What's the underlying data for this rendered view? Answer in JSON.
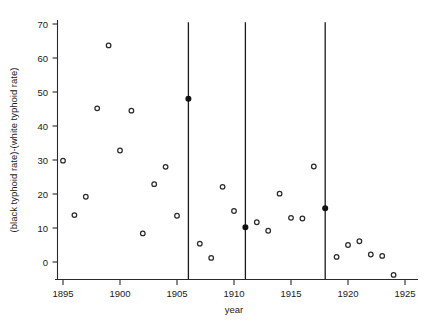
{
  "chart_data": {
    "type": "scatter",
    "title": "",
    "xlabel": "year",
    "ylabel": "(black typhoid rate)-(white typhoid rate)",
    "xlim": [
      1894,
      1926
    ],
    "ylim": [
      -6,
      72
    ],
    "grid": false,
    "legend": "none",
    "x_ticks": [
      1895,
      1900,
      1905,
      1910,
      1915,
      1920,
      1925
    ],
    "x_tick_labels": [
      "1895",
      "1900",
      "1905",
      "1910",
      "1915",
      "1920",
      "1925"
    ],
    "y_ticks": [
      0,
      10,
      20,
      30,
      40,
      50,
      60,
      70
    ],
    "y_tick_labels": [
      "0",
      "10",
      "20",
      "30",
      "40",
      "50",
      "60",
      "70"
    ],
    "marker_style": "open-circle",
    "points": [
      {
        "x": 1895,
        "y": 29.8,
        "filled": false
      },
      {
        "x": 1896,
        "y": 13.8,
        "filled": false
      },
      {
        "x": 1897,
        "y": 19.2,
        "filled": false
      },
      {
        "x": 1898,
        "y": 45.2,
        "filled": false
      },
      {
        "x": 1899,
        "y": 63.7,
        "filled": false
      },
      {
        "x": 1900,
        "y": 32.8,
        "filled": false
      },
      {
        "x": 1901,
        "y": 44.5,
        "filled": false
      },
      {
        "x": 1902,
        "y": 8.4,
        "filled": false
      },
      {
        "x": 1903,
        "y": 22.9,
        "filled": false
      },
      {
        "x": 1904,
        "y": 28.0,
        "filled": false
      },
      {
        "x": 1905,
        "y": 13.6,
        "filled": false
      },
      {
        "x": 1906,
        "y": 48.0,
        "filled": true
      },
      {
        "x": 1907,
        "y": 5.4,
        "filled": false
      },
      {
        "x": 1908,
        "y": 1.2,
        "filled": false
      },
      {
        "x": 1909,
        "y": 22.1,
        "filled": false
      },
      {
        "x": 1910,
        "y": 15.0,
        "filled": false
      },
      {
        "x": 1911,
        "y": 10.2,
        "filled": true
      },
      {
        "x": 1912,
        "y": 11.7,
        "filled": false
      },
      {
        "x": 1913,
        "y": 9.2,
        "filled": false
      },
      {
        "x": 1914,
        "y": 20.1,
        "filled": false
      },
      {
        "x": 1915,
        "y": 13.0,
        "filled": false
      },
      {
        "x": 1916,
        "y": 12.8,
        "filled": false
      },
      {
        "x": 1917,
        "y": 28.1,
        "filled": false
      },
      {
        "x": 1918,
        "y": 15.8,
        "filled": true
      },
      {
        "x": 1919,
        "y": 1.5,
        "filled": false
      },
      {
        "x": 1920,
        "y": 5.0,
        "filled": false
      },
      {
        "x": 1921,
        "y": 6.1,
        "filled": false
      },
      {
        "x": 1922,
        "y": 2.2,
        "filled": false
      },
      {
        "x": 1923,
        "y": 1.8,
        "filled": false
      },
      {
        "x": 1924,
        "y": -3.8,
        "filled": false
      }
    ],
    "vertical_lines": [
      {
        "x": 1906,
        "y_top": 70.5,
        "y_bottom": -5.0
      },
      {
        "x": 1911,
        "y_top": 70.5,
        "y_bottom": -5.0
      },
      {
        "x": 1918,
        "y_top": 70.5,
        "y_bottom": -5.0
      }
    ]
  }
}
